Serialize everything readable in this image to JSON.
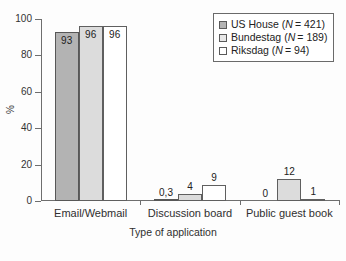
{
  "chart_data": {
    "type": "bar",
    "title": "",
    "xlabel": "Type of application",
    "ylabel": "%",
    "ylim": [
      0,
      100
    ],
    "yticks": [
      0,
      20,
      40,
      60,
      80,
      100
    ],
    "ytick_labels": [
      "0",
      "20",
      "40",
      "60",
      "80",
      "100"
    ],
    "grid": false,
    "legend_position": "top-right",
    "categories": [
      "Email/Webmail",
      "Discussion board",
      "Public guest book"
    ],
    "series": [
      {
        "name": "US House",
        "n": 421,
        "legend_label": "US House (N = 421)",
        "color": "#b3b3b3",
        "values": [
          93,
          0.3,
          0
        ],
        "value_labels": [
          "93",
          "0,3",
          "0"
        ]
      },
      {
        "name": "Bundestag",
        "n": 189,
        "legend_label": "Bundestag (N = 189)",
        "color": "#dcdcdc",
        "values": [
          96,
          4,
          12
        ],
        "value_labels": [
          "96",
          "4",
          "12"
        ]
      },
      {
        "name": "Riksdag",
        "n": 94,
        "legend_label": "Riksdag (N = 94)",
        "color": "#ffffff",
        "values": [
          96,
          9,
          1
        ],
        "value_labels": [
          "96",
          "9",
          "1"
        ]
      }
    ]
  },
  "legend": {
    "items": [
      {
        "label_name": "US House",
        "n_prefix": "N",
        "n_value": "= 421",
        "open": "(",
        "close": ")"
      },
      {
        "label_name": "Bundestag",
        "n_prefix": "N",
        "n_value": "= 189",
        "open": "(",
        "close": ")"
      },
      {
        "label_name": "Riksdag",
        "n_prefix": "N",
        "n_value": "= 94",
        "open": "(",
        "close": ")"
      }
    ]
  },
  "axes": {
    "y_title": "%",
    "x_title": "Type of application",
    "y_tick_labels": [
      "100",
      "80",
      "60",
      "40",
      "20",
      "0"
    ],
    "x_categories": [
      "Email/Webmail",
      "Discussion board",
      "Public guest book"
    ]
  }
}
